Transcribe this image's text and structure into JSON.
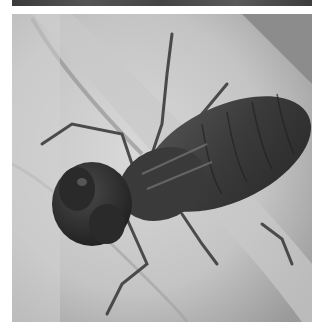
{
  "image": {
    "subject": "dragonfly nymph on a hand",
    "color_mode": "grayscale",
    "colors": {
      "background": "#ffffff",
      "skin_light": "#d6d6d6",
      "skin_mid": "#b5b5b5",
      "skin_shadow": "#8e8e8e",
      "backdrop": "#8a8a8a",
      "insect_dark": "#2e2e2e",
      "insect_mid": "#4a4a4a"
    }
  }
}
